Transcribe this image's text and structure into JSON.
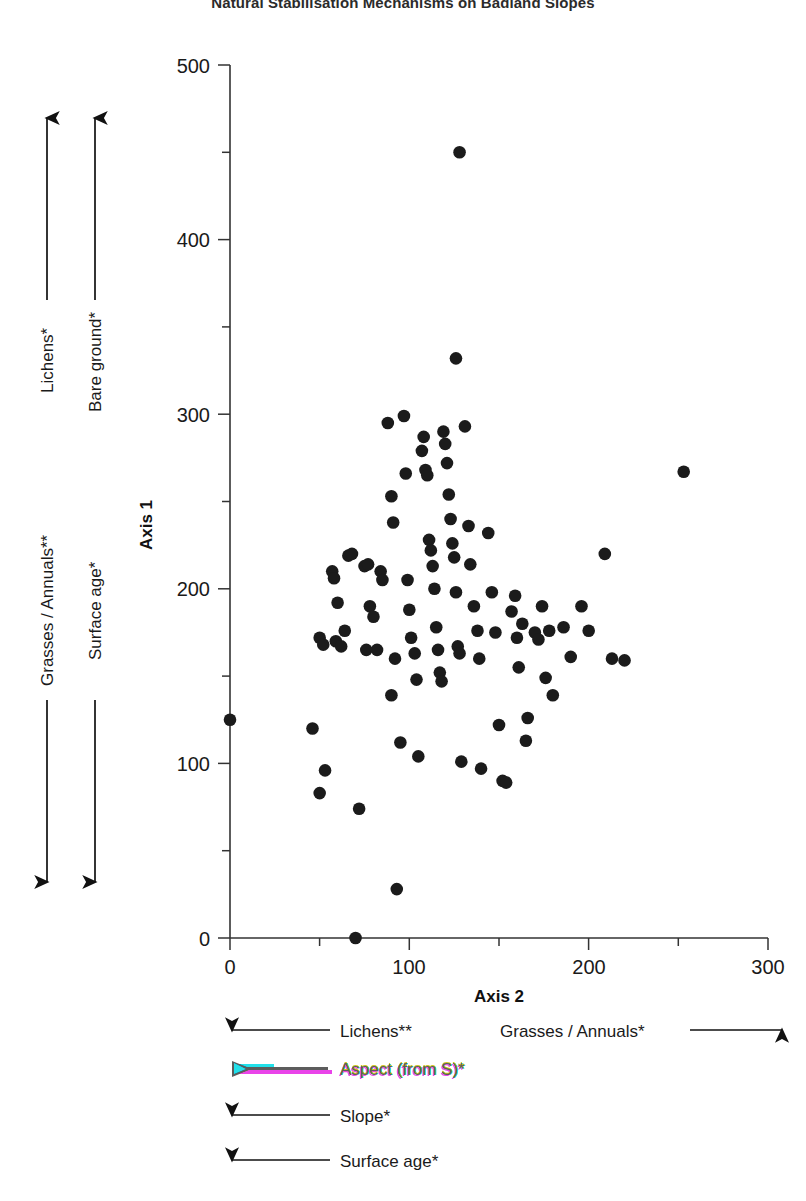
{
  "title": "Natural Stabilisation Mechanisms on Badland Slopes",
  "axes": {
    "x_title": "Axis 2",
    "y_title": "Axis 1",
    "x_ticks": [
      "0",
      "100",
      "200",
      "300"
    ],
    "y_ticks": [
      "0",
      "100",
      "200",
      "300",
      "400",
      "500"
    ]
  },
  "left_gradients": {
    "up": [
      {
        "label": "Lichens*",
        "direction": "up"
      },
      {
        "label": "Bare ground*",
        "direction": "up"
      }
    ],
    "down": [
      {
        "label": "Grasses / Annuals**",
        "direction": "down"
      },
      {
        "label": "Surface age*",
        "direction": "down"
      }
    ]
  },
  "bottom_legend": [
    {
      "label": "Lichens**",
      "direction": "left",
      "artifact": false
    },
    {
      "label": "Grasses / Annuals*",
      "direction": "right",
      "artifact": false
    },
    {
      "label": "Aspect (from S)*",
      "direction": "left",
      "artifact": true
    },
    {
      "label": "Slope*",
      "direction": "left",
      "artifact": false
    },
    {
      "label": "Surface age*",
      "direction": "left",
      "artifact": false
    }
  ],
  "chart_data": {
    "type": "scatter",
    "title": "Natural Stabilisation Mechanisms on Badland Slopes",
    "xlabel": "Axis 2",
    "ylabel": "Axis 1",
    "xlim": [
      0,
      300
    ],
    "ylim": [
      0,
      500
    ],
    "x_ticks": [
      0,
      100,
      200,
      300
    ],
    "y_ticks": [
      0,
      100,
      200,
      300,
      400,
      500
    ],
    "x_minor_tick_interval": 50,
    "y_minor_tick_interval": 50,
    "grid": false,
    "legend": "none",
    "marker": {
      "shape": "circle",
      "color": "#1b1b1b",
      "size": 9
    },
    "n_points": 96,
    "points": [
      [
        0,
        125
      ],
      [
        46,
        120
      ],
      [
        50,
        172
      ],
      [
        52,
        168
      ],
      [
        53,
        96
      ],
      [
        50,
        83
      ],
      [
        57,
        210
      ],
      [
        58,
        206
      ],
      [
        60,
        192
      ],
      [
        59,
        170
      ],
      [
        62,
        167
      ],
      [
        64,
        176
      ],
      [
        66,
        219
      ],
      [
        68,
        220
      ],
      [
        70,
        0
      ],
      [
        72,
        74
      ],
      [
        75,
        213
      ],
      [
        77,
        214
      ],
      [
        78,
        190
      ],
      [
        76,
        165
      ],
      [
        80,
        184
      ],
      [
        82,
        165
      ],
      [
        84,
        210
      ],
      [
        85,
        205
      ],
      [
        88,
        295
      ],
      [
        90,
        253
      ],
      [
        91,
        238
      ],
      [
        90,
        139
      ],
      [
        92,
        160
      ],
      [
        93,
        28
      ],
      [
        95,
        112
      ],
      [
        97,
        299
      ],
      [
        98,
        266
      ],
      [
        99,
        205
      ],
      [
        100,
        188
      ],
      [
        101,
        172
      ],
      [
        103,
        163
      ],
      [
        104,
        148
      ],
      [
        105,
        104
      ],
      [
        107,
        279
      ],
      [
        108,
        287
      ],
      [
        109,
        268
      ],
      [
        110,
        265
      ],
      [
        111,
        228
      ],
      [
        112,
        222
      ],
      [
        113,
        213
      ],
      [
        114,
        200
      ],
      [
        115,
        178
      ],
      [
        116,
        165
      ],
      [
        117,
        152
      ],
      [
        118,
        147
      ],
      [
        119,
        290
      ],
      [
        120,
        283
      ],
      [
        121,
        272
      ],
      [
        122,
        254
      ],
      [
        123,
        240
      ],
      [
        124,
        226
      ],
      [
        125,
        218
      ],
      [
        126,
        198
      ],
      [
        127,
        167
      ],
      [
        128,
        163
      ],
      [
        129,
        101
      ],
      [
        126,
        332
      ],
      [
        128,
        450
      ],
      [
        131,
        293
      ],
      [
        133,
        236
      ],
      [
        134,
        214
      ],
      [
        136,
        190
      ],
      [
        138,
        176
      ],
      [
        139,
        160
      ],
      [
        140,
        97
      ],
      [
        144,
        232
      ],
      [
        146,
        198
      ],
      [
        148,
        175
      ],
      [
        150,
        122
      ],
      [
        152,
        90
      ],
      [
        154,
        89
      ],
      [
        157,
        187
      ],
      [
        159,
        196
      ],
      [
        160,
        172
      ],
      [
        161,
        155
      ],
      [
        163,
        180
      ],
      [
        165,
        113
      ],
      [
        166,
        126
      ],
      [
        170,
        175
      ],
      [
        172,
        171
      ],
      [
        174,
        190
      ],
      [
        176,
        149
      ],
      [
        178,
        176
      ],
      [
        180,
        139
      ],
      [
        186,
        178
      ],
      [
        190,
        161
      ],
      [
        196,
        190
      ],
      [
        200,
        176
      ],
      [
        209,
        220
      ],
      [
        213,
        160
      ],
      [
        220,
        159
      ],
      [
        253,
        267
      ]
    ]
  }
}
